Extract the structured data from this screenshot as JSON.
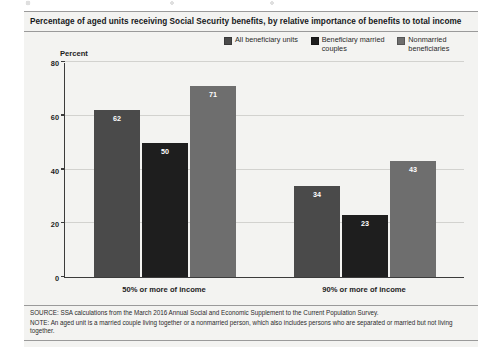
{
  "figure": {
    "title": "Percentage of aged units receiving Social Security benefits, by relative importance of benefits to total income",
    "percent_caption": "Percent",
    "source_note": "SOURCE: SSA calculations from the March 2016 Annual Social and Economic Supplement to the Current Population Survey.",
    "general_note": "NOTE: An aged unit is a married couple living together or a nonmarried person, which also includes persons who are separated or married but not living together."
  },
  "colors": {
    "series_all_beneficiary_units": "#4a4a4a",
    "series_beneficiary_married_couples": "#1e1e1e",
    "series_nonmarried_beneficiaries": "#6e6e6e",
    "panel_background": "#f3f3f1",
    "axis": "#3b3b3b",
    "gridline": "#d2d2cf",
    "value_label": "#ffffff"
  },
  "legend": {
    "items": [
      {
        "label": "All beneficiary units",
        "color": "#4a4a4a"
      },
      {
        "label": "Beneficiary married couples",
        "color": "#1e1e1e"
      },
      {
        "label": "Nonmarried beneficiaries",
        "color": "#6e6e6e"
      }
    ]
  },
  "chart_data": {
    "type": "bar",
    "title": "Percentage of aged units receiving Social Security benefits, by relative importance of benefits to total income",
    "xlabel": "",
    "ylabel": "Percent",
    "ylim": [
      0,
      80
    ],
    "yticks": [
      0,
      20,
      40,
      60,
      80
    ],
    "ytick_labels": [
      "0",
      "20",
      "40",
      "60",
      "80"
    ],
    "grid": true,
    "legend_position": "top-right",
    "categories": [
      "50% or more of income",
      "90% or more of income"
    ],
    "series": [
      {
        "name": "All beneficiary units",
        "color": "#4a4a4a",
        "values": [
          62,
          34
        ]
      },
      {
        "name": "Beneficiary married couples",
        "color": "#1e1e1e",
        "values": [
          50,
          23
        ]
      },
      {
        "name": "Nonmarried beneficiaries",
        "color": "#6e6e6e",
        "values": [
          71,
          43
        ]
      }
    ],
    "data_labels": [
      [
        "62",
        "50",
        "71"
      ],
      [
        "34",
        "23",
        "43"
      ]
    ]
  }
}
